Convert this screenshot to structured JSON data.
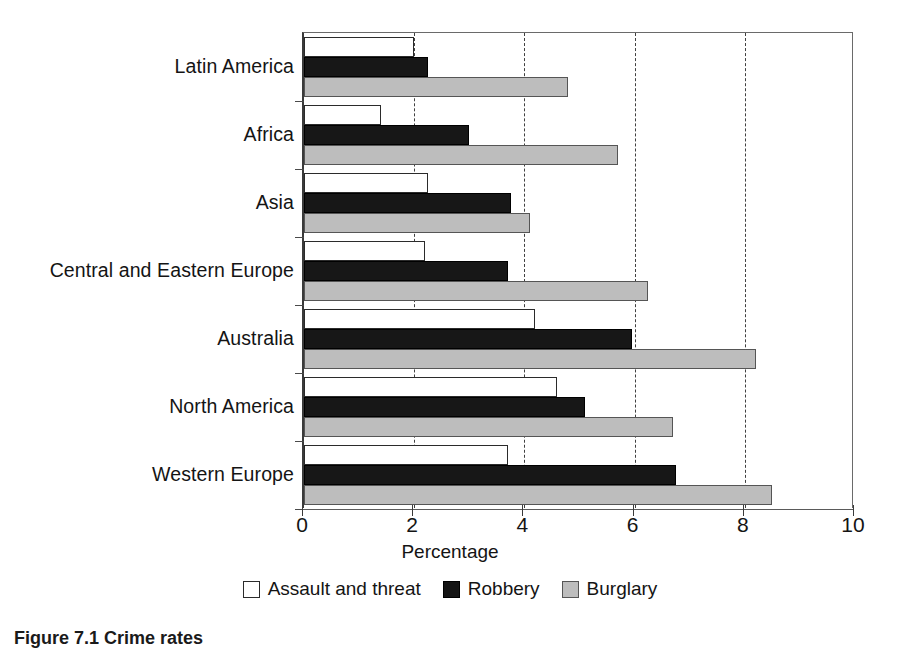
{
  "chart_data": {
    "type": "bar",
    "orientation": "horizontal",
    "title": "",
    "xlabel": "Percentage",
    "ylabel": "",
    "xlim": [
      0,
      10
    ],
    "xticks": [
      0,
      2,
      4,
      6,
      8,
      10
    ],
    "xticklabels": [
      "0",
      "2",
      "4",
      "6",
      "8",
      "10"
    ],
    "grid": "vertical-dashed",
    "legend_position": "bottom-center",
    "categories": [
      "Latin America",
      "Africa",
      "Asia",
      "Central and Eastern Europe",
      "Australia",
      "North America",
      "Western Europe"
    ],
    "series": [
      {
        "name": "Assault and threat",
        "color": "#ffffff",
        "values": [
          2.0,
          1.4,
          2.25,
          2.2,
          4.2,
          4.6,
          3.7
        ]
      },
      {
        "name": "Robbery",
        "color": "#141414",
        "values": [
          2.25,
          3.0,
          3.75,
          3.7,
          5.95,
          5.1,
          6.75
        ]
      },
      {
        "name": "Burglary",
        "color": "#bdbdbd",
        "values": [
          4.8,
          5.7,
          4.1,
          6.25,
          8.2,
          6.7,
          8.5
        ]
      }
    ]
  },
  "legend": {
    "items": [
      {
        "label": "Assault and threat",
        "swatch": "white"
      },
      {
        "label": "Robbery",
        "swatch": "black"
      },
      {
        "label": "Burglary",
        "swatch": "gray"
      }
    ]
  },
  "caption": {
    "text": "Figure 7.1 Crime rates"
  }
}
